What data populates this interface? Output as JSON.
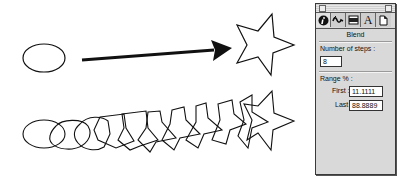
{
  "illustration": {
    "top_row": {
      "start_shape": "ellipse",
      "arrow": "arrow-right",
      "end_shape": "five-point-star"
    },
    "blend_row": {
      "start_shape": "ellipse",
      "intermediate_steps": 8,
      "end_shape": "five-point-star"
    }
  },
  "palette": {
    "tabs": [
      {
        "name": "info-icon",
        "selected": true
      },
      {
        "name": "blend-icon",
        "selected": false
      },
      {
        "name": "fill-icon",
        "selected": false
      },
      {
        "name": "text-icon",
        "label": "A",
        "selected": false
      },
      {
        "name": "document-icon",
        "selected": false
      }
    ],
    "title": "Blend",
    "steps_label": "Number of steps :",
    "steps_value": "8",
    "range_label": "Range % :",
    "first_label": "First :",
    "first_value": "11.1111",
    "last_label": "Last :",
    "last_value": "88.8889"
  }
}
